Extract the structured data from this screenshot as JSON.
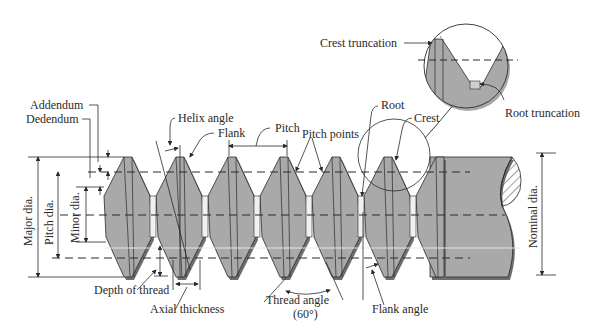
{
  "diagram": {
    "colors": {
      "background": "#ffffff",
      "thread_fill": "#a9a9a9",
      "thread_shadow": "#6e6e6e",
      "line": "#2a2a2a",
      "highlight": "#e6e6e6"
    },
    "labels": {
      "addendum": "Addendum",
      "dedendum": "Dedendum",
      "helix_angle": "Helix angle",
      "flank": "Flank",
      "pitch": "Pitch",
      "pitch_points": "Pitch points",
      "root": "Root",
      "crest": "Crest",
      "crest_truncation": "Crest truncation",
      "root_truncation": "Root truncation",
      "major_dia": "Major dia.",
      "pitch_dia": "Pitch dia.",
      "minor_dia": "Minor dia.",
      "nominal_dia": "Nominal dia.",
      "depth_of_thread": "Depth of thread",
      "axial_thickness": "Axial thickness",
      "thread_angle": "Thread angle",
      "thread_angle_value": "(60°)",
      "flank_angle": "Flank angle"
    }
  }
}
